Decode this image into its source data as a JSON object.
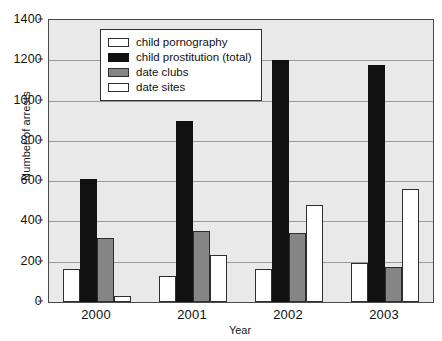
{
  "chart_data": {
    "type": "bar",
    "title": "",
    "xlabel": "Year",
    "ylabel": "Number of arrests",
    "categories": [
      "2000",
      "2001",
      "2002",
      "2003"
    ],
    "ylim": [
      0,
      1400
    ],
    "yticks": [
      0,
      200,
      400,
      600,
      800,
      1000,
      1200,
      1400
    ],
    "ytick_labels": [
      "0",
      "200",
      "400",
      "600",
      "800",
      "1000",
      "1200",
      "1400"
    ],
    "grid": true,
    "legend_position": "top-center",
    "series": [
      {
        "name": "child pornography",
        "color": "#ffffff",
        "swatch": "white",
        "values": [
          165,
          130,
          165,
          195
        ]
      },
      {
        "name": "child prostitution (total)",
        "color": "#111111",
        "swatch": "black",
        "values": [
          610,
          900,
          1200,
          1175
        ]
      },
      {
        "name": "date clubs",
        "color": "#858585",
        "swatch": "gray",
        "values": [
          320,
          355,
          345,
          175
        ]
      },
      {
        "name": "date sites",
        "color": "#ffffff",
        "swatch": "white",
        "values": [
          30,
          235,
          480,
          560
        ]
      }
    ]
  }
}
